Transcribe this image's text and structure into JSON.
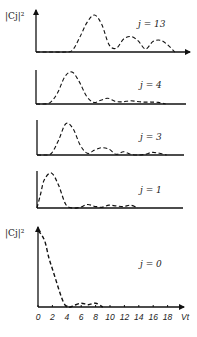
{
  "chart_data": {
    "type": "line",
    "title": "",
    "xlabel": "Vt",
    "ylabel": "|Cj|²",
    "x_ticks": [
      "0",
      "2",
      "4",
      "6",
      "8",
      "10",
      "12",
      "14",
      "16",
      "18"
    ],
    "xlim": [
      0,
      19
    ],
    "grid": false,
    "legend": null,
    "line_style": "dashed",
    "panels": [
      {
        "label": "j = 13",
        "x": [
          0,
          2,
          4,
          5,
          6,
          7,
          8,
          9,
          10,
          11,
          12,
          13,
          14,
          15,
          16,
          17,
          18,
          19
        ],
        "y": [
          0,
          0,
          0,
          0.05,
          0.4,
          0.8,
          1.0,
          0.75,
          0.2,
          0.1,
          0.35,
          0.42,
          0.3,
          0.08,
          0.28,
          0.32,
          0.2,
          0
        ]
      },
      {
        "label": "j = 4",
        "x": [
          0,
          1,
          2,
          3,
          4,
          5,
          6,
          7,
          8,
          9,
          10,
          11,
          12,
          13,
          14,
          15,
          16,
          17,
          18
        ],
        "y": [
          0,
          0,
          0.05,
          0.35,
          0.85,
          1.0,
          0.7,
          0.25,
          0.05,
          0.12,
          0.18,
          0.08,
          0.07,
          0.1,
          0.08,
          0.06,
          0.06,
          0.05,
          0
        ]
      },
      {
        "label": "j = 3",
        "x": [
          0,
          1,
          2,
          3,
          4,
          5,
          6,
          7,
          8,
          9,
          10,
          11,
          12,
          13,
          14,
          15,
          16,
          17,
          18
        ],
        "y": [
          0,
          0,
          0.05,
          0.45,
          0.95,
          0.8,
          0.3,
          0.05,
          0.15,
          0.22,
          0.18,
          0.02,
          0.1,
          0.02,
          0.0,
          0.02,
          0.08,
          0.05,
          0
        ]
      },
      {
        "label": "j = 1",
        "x": [
          0,
          0.5,
          1,
          2,
          3,
          4,
          5,
          6,
          7,
          8,
          9,
          10,
          11,
          12,
          13,
          14
        ],
        "y": [
          0,
          0.4,
          0.8,
          1.0,
          0.65,
          0.1,
          0.0,
          0.02,
          0.1,
          0.05,
          0.02,
          0.08,
          0.06,
          0.04,
          0.08,
          0
        ]
      },
      {
        "label": "j = 0",
        "x": [
          0,
          0.5,
          1,
          1.5,
          2,
          2.5,
          3,
          3.5,
          4,
          4.5,
          5,
          6,
          7,
          8,
          9
        ],
        "y": [
          1.0,
          0.95,
          0.85,
          0.65,
          0.5,
          0.35,
          0.2,
          0.07,
          0.0,
          0.0,
          0.02,
          0.05,
          0.03,
          0.05,
          0
        ]
      }
    ]
  },
  "labels": {
    "ylabel_top": "|Cj|²",
    "ylabel_bottom": "|Cj|²",
    "xlabel": "Vt",
    "j13": "j = 13",
    "j4": "j = 4",
    "j3": "j = 3",
    "j1": "j = 1",
    "j0": "j = 0"
  }
}
